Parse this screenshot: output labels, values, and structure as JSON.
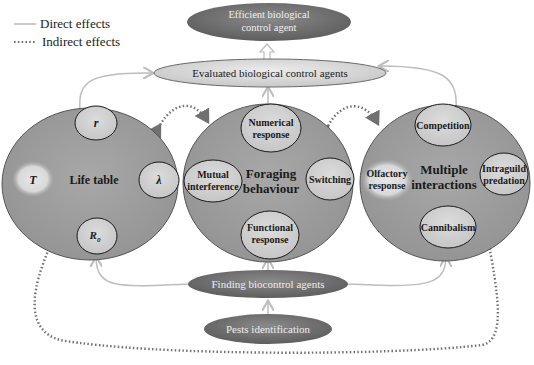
{
  "legend": {
    "direct": "Direct effects",
    "indirect": "Indirect effects"
  },
  "nodes": {
    "top": {
      "label_line1": "Efficient biological",
      "label_line2": "control agent"
    },
    "evaluated": {
      "label": "Evaluated biological control agents"
    },
    "finding": {
      "label": "Finding biocontrol agents"
    },
    "pests": {
      "label": "Pests identification"
    }
  },
  "circles": {
    "life_table": {
      "title": "Life table",
      "items": {
        "r": "r",
        "lambda": "λ",
        "R0_main": "R",
        "R0_sub": "0",
        "T": "T"
      }
    },
    "foraging": {
      "title_line1": "Foraging",
      "title_line2": "behaviour",
      "items": {
        "numerical_1": "Numerical",
        "numerical_2": "response",
        "mutual_1": "Mutual",
        "mutual_2": "interference",
        "switching": "Switching",
        "functional_1": "Functional",
        "functional_2": "response"
      }
    },
    "multiple": {
      "title_line1": "Multiple",
      "title_line2": "interactions",
      "items": {
        "competition": "Competition",
        "olfactory_1": "Olfactory",
        "olfactory_2": "response",
        "intraguild_1": "Intraguild",
        "intraguild_2": "predation",
        "cannibalism": "Cannibalism"
      }
    }
  },
  "colors": {
    "big_circle": "#9a9a9a",
    "sub_circle": "#d4d4d4",
    "highlight": "#e2e2e2",
    "dark_ellipse": "#707070",
    "light_ellipse": "#dcdcdc",
    "direct_line": "#bdbdbd",
    "indirect_line": "#707070"
  }
}
